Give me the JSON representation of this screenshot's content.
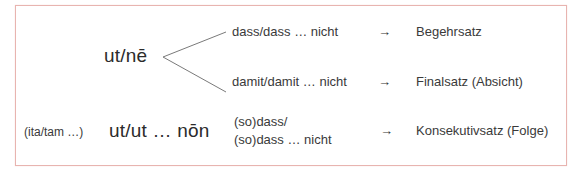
{
  "diagram": {
    "frame_color": "#e8b4b0",
    "rows": [
      {
        "latin": "ut/nē",
        "branches": [
          {
            "german": "dass/dass … nicht",
            "arrow": "→",
            "result": "Begehrsatz"
          },
          {
            "german": "damit/damit … nicht",
            "arrow": "→",
            "result": "Finalsatz (Absicht)"
          }
        ]
      },
      {
        "prefix": "(ita/tam …)",
        "latin": "ut/ut … nōn",
        "german_line1": "(so)dass/",
        "german_line2": "(so)dass … nicht",
        "arrow": "→",
        "result": "Konsekutivsatz (Folge)"
      }
    ]
  }
}
